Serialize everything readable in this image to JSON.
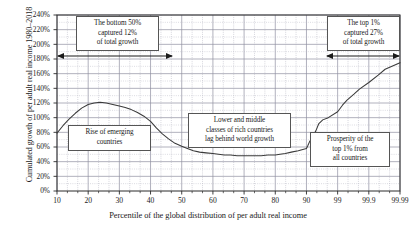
{
  "chart_data": {
    "type": "line",
    "title": "",
    "xlabel": "Percentile of the global distribution of per adult real income",
    "ylabel": "Cumulated growth of per adult real income 1980–2018",
    "ylim": [
      0,
      240
    ],
    "ytick_labels": [
      "0%",
      "20%",
      "40%",
      "60%",
      "80%",
      "100%",
      "120%",
      "140%",
      "160%",
      "180%",
      "200%",
      "220%",
      "240%"
    ],
    "ytick_values": [
      0,
      20,
      40,
      60,
      80,
      100,
      120,
      140,
      160,
      180,
      200,
      220,
      240
    ],
    "xtick_labels": [
      "10",
      "20",
      "30",
      "40",
      "50",
      "60",
      "70",
      "80",
      "90",
      "99",
      "99.9",
      "99.99"
    ],
    "xtick_values": [
      10,
      20,
      30,
      40,
      50,
      60,
      70,
      80,
      90,
      99,
      99.9,
      99.99
    ],
    "grid": true,
    "legend": "none",
    "series": [
      {
        "name": "Cumulated real income growth 1980-2018",
        "x": [
          10,
          12,
          14,
          16,
          18,
          20,
          22,
          24,
          26,
          28,
          30,
          32,
          34,
          36,
          38,
          40,
          42,
          44,
          46,
          48,
          50,
          52,
          54,
          56,
          58,
          60,
          62,
          64,
          66,
          68,
          70,
          72,
          74,
          76,
          78,
          80,
          82,
          84,
          86,
          88,
          90,
          91,
          92,
          93,
          94,
          95,
          96,
          97,
          98,
          99,
          99.3,
          99.5,
          99.7,
          99.8,
          99.9,
          99.95,
          99.97,
          99.99
        ],
        "values": [
          79,
          89,
          98,
          106,
          113,
          118,
          120,
          121,
          120,
          118,
          116,
          114,
          111,
          107,
          102,
          95,
          86,
          78,
          71,
          65,
          61,
          58,
          55,
          53,
          52,
          51,
          50,
          49,
          49,
          48,
          48,
          48,
          48,
          48,
          49,
          49,
          50,
          51,
          53,
          55,
          58,
          62,
          67,
          71,
          76,
          82,
          92,
          97,
          100,
          108,
          117,
          124,
          132,
          139,
          148,
          158,
          166,
          175
        ]
      }
    ],
    "annotations": [
      {
        "name": "bottom-50-note",
        "lines": [
          "The bottom 50%",
          "captured 12%",
          "of total growth"
        ]
      },
      {
        "name": "top-1-note",
        "lines": [
          "The top 1%",
          "captured 27%",
          "of total growth"
        ]
      },
      {
        "name": "emerging-countries-note",
        "lines": [
          "Rise of emerging",
          "countries"
        ]
      },
      {
        "name": "rich-countries-note",
        "lines": [
          "Lower and middle",
          "classes of rich countries",
          "lag behind world growth"
        ]
      },
      {
        "name": "prosperity-note",
        "lines": [
          "Prosperity of the",
          "top 1% from",
          "all countries"
        ]
      }
    ],
    "colors": {
      "line": "#3a3a3a",
      "grid": "#9a9aa8",
      "axis": "#2a2a2a",
      "background": "#ffffff",
      "note_border": "#555555"
    }
  }
}
